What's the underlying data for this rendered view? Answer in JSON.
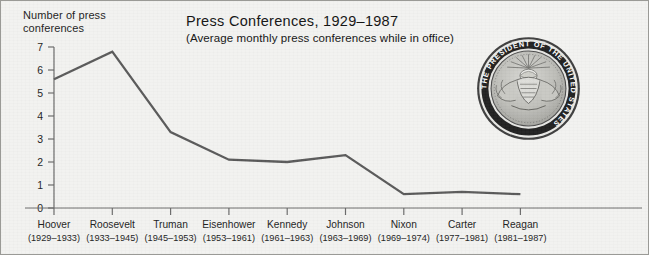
{
  "figure": {
    "y_axis_caption": "Number of press conferences",
    "seal_icon": "presidential-seal-icon",
    "seal_text": "SEAL OF THE PRESIDENT OF THE UNITED STATES",
    "background_color": "#f2f2f0",
    "line_color": "#585858",
    "axis_color": "#6a6a6a"
  },
  "chart_data": {
    "type": "line",
    "title": "Press Conferences, 1929–1987",
    "subtitle": "(Average monthly press conferences while in office)",
    "xlabel": "",
    "ylabel": "Number of press conferences",
    "ylim": [
      0,
      7
    ],
    "yticks": [
      0,
      1,
      2,
      3,
      4,
      5,
      6,
      7
    ],
    "ytick_labels": [
      "0",
      "1",
      "2",
      "3",
      "4",
      "5",
      "6",
      "7"
    ],
    "grid": false,
    "legend": "none",
    "categories": [
      "Hoover",
      "Roosevelt",
      "Truman",
      "Eisenhower",
      "Kennedy",
      "Johnson",
      "Nixon",
      "Carter",
      "Reagan"
    ],
    "category_years": [
      "(1929–1933)",
      "(1933–1945)",
      "(1945–1953)",
      "(1953–1961)",
      "(1961–1963)",
      "(1963–1969)",
      "(1969–1974)",
      "(1977–1981)",
      "(1981–1987)"
    ],
    "values": [
      5.6,
      6.8,
      3.3,
      2.1,
      2.0,
      2.3,
      0.6,
      0.7,
      0.6
    ]
  }
}
